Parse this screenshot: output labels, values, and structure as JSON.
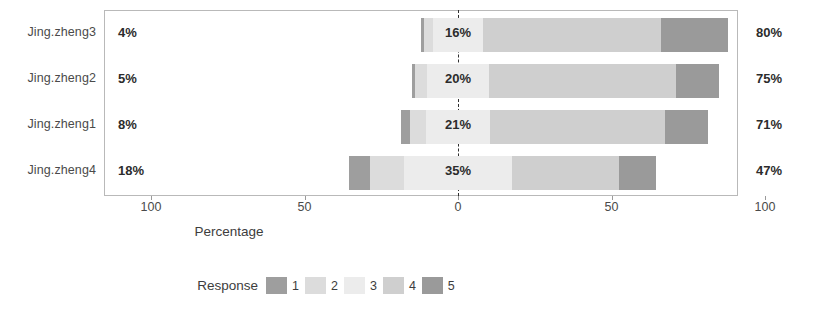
{
  "chart_data": {
    "type": "bar",
    "subtype": "diverging-stacked-likert",
    "title": "",
    "xlabel": "Percentage",
    "ylabel": "",
    "xlim": [
      -100,
      100
    ],
    "xticks": [
      100,
      50,
      0,
      50,
      100
    ],
    "xtick_labels": [
      "100",
      "50",
      "0",
      "50",
      "100"
    ],
    "grid": false,
    "legend": {
      "title": "Response",
      "position": "bottom",
      "entries": [
        {
          "label": "1",
          "color": "#9e9e9e"
        },
        {
          "label": "2",
          "color": "#dcdcdc"
        },
        {
          "label": "3",
          "color": "#ececec"
        },
        {
          "label": "4",
          "color": "#cfcfcf"
        },
        {
          "label": "5",
          "color": "#9a9a9a"
        }
      ]
    },
    "categories": [
      "Jing.zheng3",
      "Jing.zheng2",
      "Jing.zheng1",
      "Jing.zheng4"
    ],
    "series": [
      {
        "name": "1",
        "color": "#9e9e9e",
        "values": [
          1,
          1,
          3,
          7
        ]
      },
      {
        "name": "2",
        "color": "#dcdcdc",
        "values": [
          3,
          4,
          5,
          11
        ]
      },
      {
        "name": "3",
        "color": "#ececec",
        "values": [
          16,
          20,
          21,
          35
        ]
      },
      {
        "name": "4",
        "color": "#cfcfcf",
        "values": [
          58,
          61,
          57,
          35
        ]
      },
      {
        "name": "5",
        "color": "#9a9a9a",
        "values": [
          22,
          14,
          14,
          12
        ]
      }
    ],
    "rows": [
      {
        "category": "Jing.zheng3",
        "left_label": "4%",
        "center_label": "16%",
        "right_label": "80%",
        "left_value": 4,
        "neutral_value": 16,
        "right_value": 80,
        "segments": [
          {
            "response": "1",
            "value": 1,
            "color": "#9e9e9e"
          },
          {
            "response": "2",
            "value": 3,
            "color": "#dcdcdc"
          },
          {
            "response": "3",
            "value": 16,
            "color": "#ececec"
          },
          {
            "response": "4",
            "value": 58,
            "color": "#cfcfcf"
          },
          {
            "response": "5",
            "value": 22,
            "color": "#9a9a9a"
          }
        ]
      },
      {
        "category": "Jing.zheng2",
        "left_label": "5%",
        "center_label": "20%",
        "right_label": "75%",
        "left_value": 5,
        "neutral_value": 20,
        "right_value": 75,
        "segments": [
          {
            "response": "1",
            "value": 1,
            "color": "#9e9e9e"
          },
          {
            "response": "2",
            "value": 4,
            "color": "#dcdcdc"
          },
          {
            "response": "3",
            "value": 20,
            "color": "#ececec"
          },
          {
            "response": "4",
            "value": 61,
            "color": "#cfcfcf"
          },
          {
            "response": "5",
            "value": 14,
            "color": "#9a9a9a"
          }
        ]
      },
      {
        "category": "Jing.zheng1",
        "left_label": "8%",
        "center_label": "21%",
        "right_label": "71%",
        "left_value": 8,
        "neutral_value": 21,
        "right_value": 71,
        "segments": [
          {
            "response": "1",
            "value": 3,
            "color": "#9e9e9e"
          },
          {
            "response": "2",
            "value": 5,
            "color": "#dcdcdc"
          },
          {
            "response": "3",
            "value": 21,
            "color": "#ececec"
          },
          {
            "response": "4",
            "value": 57,
            "color": "#cfcfcf"
          },
          {
            "response": "5",
            "value": 14,
            "color": "#9a9a9a"
          }
        ]
      },
      {
        "category": "Jing.zheng4",
        "left_label": "18%",
        "center_label": "35%",
        "right_label": "47%",
        "left_value": 18,
        "neutral_value": 35,
        "right_value": 47,
        "segments": [
          {
            "response": "1",
            "value": 7,
            "color": "#9e9e9e"
          },
          {
            "response": "2",
            "value": 11,
            "color": "#dcdcdc"
          },
          {
            "response": "3",
            "value": 35,
            "color": "#ececec"
          },
          {
            "response": "4",
            "value": 35,
            "color": "#cfcfcf"
          },
          {
            "response": "5",
            "value": 12,
            "color": "#9a9a9a"
          }
        ]
      }
    ]
  },
  "axis": {
    "title": "Percentage",
    "ticks": [
      "100",
      "50",
      "0",
      "50",
      "100"
    ]
  },
  "legend": {
    "title": "Response",
    "items": [
      "1",
      "2",
      "3",
      "4",
      "5"
    ]
  }
}
